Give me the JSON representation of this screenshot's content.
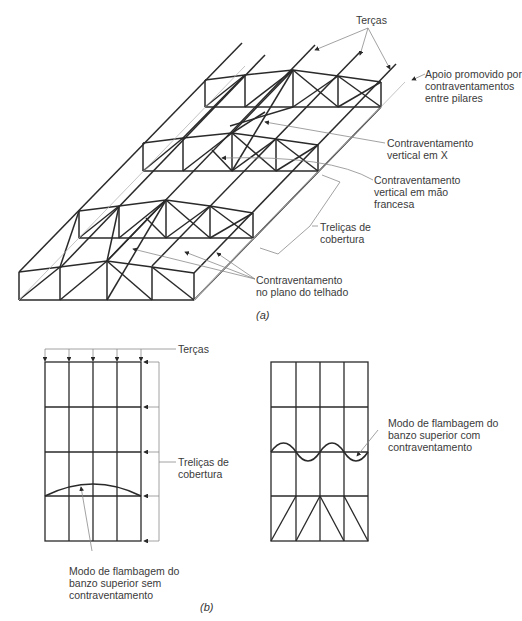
{
  "figure_a": {
    "caption": "(a)",
    "labels": {
      "tercas": "Terças",
      "apoio": "Apoio promovido por\ncontraventamentos\nentre pilares",
      "contrav_x": "Contraventamento\nvertical em X",
      "contrav_mao": "Contraventamento\nvertical em mão\nfrancesa",
      "trelicas": "Treliças de\ncobertura",
      "contrav_telhado": "Contraventamento\nno plano do telhado"
    }
  },
  "figure_b": {
    "caption": "(b)",
    "labels": {
      "tercas": "Terças",
      "trelicas": "Treliças de\ncobertura",
      "sem_contrav": "Modo de flambagem do\nbanzo superior sem\ncontraventamento",
      "com_contrav": "Modo de flambagem do\nbanzo superior com\ncontraventamento"
    }
  },
  "colors": {
    "structure": "#2a2a2a",
    "leader": "#9a9a9a",
    "text": "#3a3a3a"
  }
}
